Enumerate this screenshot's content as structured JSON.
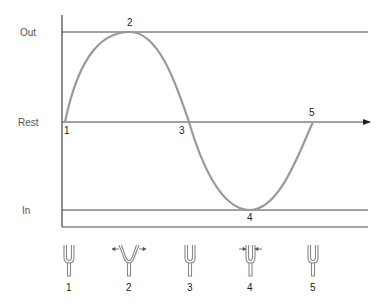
{
  "diagram": {
    "type": "waveform-with-tuning-forks",
    "y_levels": {
      "out": "Out",
      "rest": "Rest",
      "in": "In"
    },
    "wave_points": [
      {
        "label": "1",
        "position": "rest"
      },
      {
        "label": "2",
        "position": "out"
      },
      {
        "label": "3",
        "position": "rest"
      },
      {
        "label": "4",
        "position": "in"
      },
      {
        "label": "5",
        "position": "rest"
      }
    ],
    "forks": [
      {
        "label": "1",
        "state": "rest"
      },
      {
        "label": "2",
        "state": "tines-out"
      },
      {
        "label": "3",
        "state": "rest"
      },
      {
        "label": "4",
        "state": "tines-in"
      },
      {
        "label": "5",
        "state": "rest"
      }
    ],
    "colors": {
      "axis": "#333333",
      "wave": "#999999",
      "fork": "#888888"
    }
  }
}
